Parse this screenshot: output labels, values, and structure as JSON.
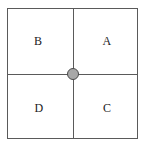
{
  "figure": {
    "background_color": "#ffffff",
    "frame": {
      "stroke_color": "#5a5a5a",
      "fill_color": "#ffffff"
    },
    "divider": {
      "stroke_color": "#5a5a5a"
    },
    "origin_node": {
      "label": "",
      "fill_color": "#a8a8a8",
      "stroke_color": "#4a4a4a"
    },
    "quadrants": [
      {
        "id": "top-left",
        "label": "B"
      },
      {
        "id": "top-right",
        "label": "A"
      },
      {
        "id": "bottom-left",
        "label": "D"
      },
      {
        "id": "bottom-right",
        "label": "C"
      }
    ]
  }
}
